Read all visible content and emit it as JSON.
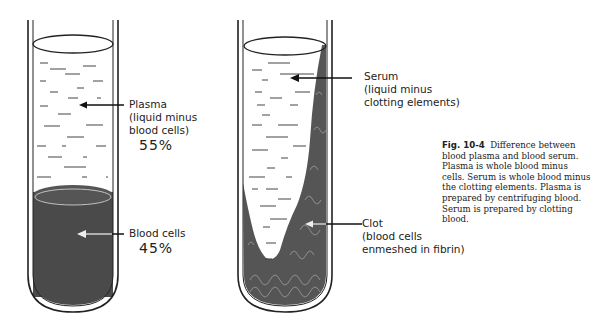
{
  "figure": {
    "number": "Fig. 10-4",
    "caption": "Difference between blood plasma and blood serum. Plasma is whole blood minus cells. Serum is whole blood minus the clotting elements. Plasma is prepared by centrifuging blood. Serum is prepared by clotting blood."
  },
  "tube_left": {
    "name": "Plasma tube (centrifuged blood)",
    "plasma": {
      "label": "Plasma",
      "desc_line1": "(liquid minus",
      "desc_line2": "blood cells)",
      "percent": "55%"
    },
    "cells": {
      "label": "Blood cells",
      "percent": "45%"
    }
  },
  "tube_right": {
    "name": "Serum tube (clotted blood)",
    "serum": {
      "label": "Serum",
      "desc_line1": "(liquid minus",
      "desc_line2": "clotting elements)"
    },
    "clot": {
      "label": "Clot",
      "desc_line1": "(blood cells",
      "desc_line2": "enmeshed in fibrin)"
    }
  },
  "colors": {
    "blood_cells": "#4a4a4a",
    "outline": "#222222",
    "clot": "#555555"
  }
}
